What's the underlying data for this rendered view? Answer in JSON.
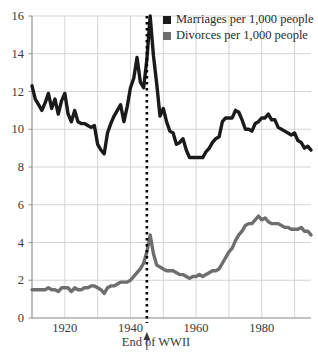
{
  "chart_data": {
    "type": "line",
    "title": "",
    "xlabel": "",
    "ylabel": "",
    "xlim": [
      1910,
      1995
    ],
    "ylim": [
      0,
      16
    ],
    "grid": true,
    "legend_position": "top-right",
    "y_ticks": [
      0,
      2,
      4,
      6,
      8,
      10,
      12,
      14,
      16
    ],
    "y_tick_labels": [
      "0",
      "2",
      "4",
      "6",
      "8",
      "10",
      "12",
      "14",
      "16"
    ],
    "x_ticks": [
      1920,
      1940,
      1960,
      1980
    ],
    "x_tick_labels": [
      "1920",
      "1940",
      "1960",
      "1980"
    ],
    "x_gridlines": [
      1910,
      1920,
      1930,
      1940,
      1950,
      1960,
      1970,
      1980,
      1990
    ],
    "annotations": [
      {
        "label": "End of WWII",
        "x": 1945,
        "style": "dotted-vertical-line-with-arrow",
        "color": "#000000"
      }
    ],
    "legend": [
      {
        "name": "Marriages per 1,000 people",
        "color": "#1a1a1a"
      },
      {
        "name": "Divorces per 1,000 people",
        "color": "#6e6e6e"
      }
    ],
    "x": [
      1910,
      1911,
      1912,
      1913,
      1914,
      1915,
      1916,
      1917,
      1918,
      1919,
      1920,
      1921,
      1922,
      1923,
      1924,
      1925,
      1926,
      1927,
      1928,
      1929,
      1930,
      1931,
      1932,
      1933,
      1934,
      1935,
      1936,
      1937,
      1938,
      1939,
      1940,
      1941,
      1942,
      1943,
      1944,
      1945,
      1946,
      1947,
      1948,
      1949,
      1950,
      1951,
      1952,
      1953,
      1954,
      1955,
      1956,
      1957,
      1958,
      1959,
      1960,
      1961,
      1962,
      1963,
      1964,
      1965,
      1966,
      1967,
      1968,
      1969,
      1970,
      1971,
      1972,
      1973,
      1974,
      1975,
      1976,
      1977,
      1978,
      1979,
      1980,
      1981,
      1982,
      1983,
      1984,
      1985,
      1986,
      1987,
      1988,
      1989,
      1990,
      1991,
      1992,
      1993,
      1994,
      1995
    ],
    "series": [
      {
        "name": "Marriages per 1,000 people",
        "color": "#1a1a1a",
        "values": [
          12.3,
          11.6,
          11.3,
          11.0,
          11.4,
          11.9,
          11.1,
          11.6,
          10.8,
          11.5,
          11.9,
          10.8,
          10.4,
          11.0,
          10.4,
          10.3,
          10.3,
          10.2,
          10.1,
          10.2,
          9.2,
          8.9,
          8.7,
          9.8,
          10.3,
          10.7,
          11.0,
          11.3,
          10.4,
          11.2,
          12.2,
          12.7,
          13.8,
          12.5,
          12.2,
          13.7,
          16.0,
          13.9,
          12.4,
          10.7,
          11.1,
          10.4,
          9.9,
          9.8,
          9.2,
          9.3,
          9.5,
          8.9,
          8.5,
          8.5,
          8.5,
          8.5,
          8.5,
          8.8,
          9.0,
          9.3,
          9.5,
          9.6,
          10.4,
          10.6,
          10.6,
          10.6,
          11.0,
          10.9,
          10.5,
          10.0,
          10.0,
          9.9,
          10.3,
          10.4,
          10.6,
          10.6,
          10.8,
          10.5,
          10.5,
          10.1,
          10.0,
          9.9,
          9.8,
          9.7,
          9.8,
          9.4,
          9.3,
          9.0,
          9.1,
          8.9
        ]
      },
      {
        "name": "Divorces per 1,000 people",
        "color": "#6e6e6e",
        "values": [
          1.5,
          1.5,
          1.5,
          1.5,
          1.5,
          1.6,
          1.5,
          1.5,
          1.4,
          1.6,
          1.6,
          1.6,
          1.4,
          1.6,
          1.5,
          1.5,
          1.6,
          1.6,
          1.7,
          1.7,
          1.6,
          1.5,
          1.3,
          1.6,
          1.7,
          1.7,
          1.8,
          1.9,
          1.9,
          1.9,
          2.0,
          2.2,
          2.4,
          2.6,
          2.9,
          3.5,
          4.4,
          3.4,
          2.8,
          2.7,
          2.6,
          2.5,
          2.5,
          2.5,
          2.4,
          2.3,
          2.3,
          2.2,
          2.1,
          2.2,
          2.2,
          2.3,
          2.2,
          2.3,
          2.4,
          2.5,
          2.5,
          2.6,
          2.9,
          3.2,
          3.5,
          3.7,
          4.1,
          4.4,
          4.6,
          4.9,
          5.0,
          5.0,
          5.2,
          5.4,
          5.2,
          5.3,
          5.1,
          5.0,
          5.0,
          5.0,
          4.9,
          4.8,
          4.8,
          4.7,
          4.7,
          4.7,
          4.8,
          4.6,
          4.6,
          4.4
        ]
      }
    ]
  },
  "legend": {
    "marriages_label": "Marriages per 1,000 people",
    "divorces_label": "Divorces per 1,000 people"
  },
  "annotation": {
    "wwii_label": "End of WWII"
  },
  "axis": {
    "y_labels": [
      "16",
      "14",
      "12",
      "10",
      "8",
      "6",
      "4",
      "2",
      "0"
    ],
    "x_labels": [
      "1920",
      "1940",
      "1960",
      "1980"
    ]
  }
}
